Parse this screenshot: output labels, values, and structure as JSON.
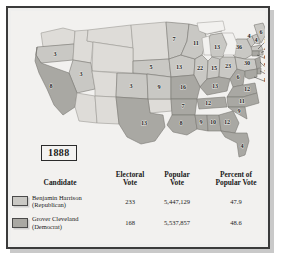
{
  "figure": {
    "year_label": "1888",
    "colors": {
      "republican_fill": "#c9c8c4",
      "democrat_fill": "#a9a8a3",
      "territory_fill": "#dedcd8",
      "water_fill": "#f2f1ef",
      "border": "#7a7874",
      "frame": "#3b3b3b",
      "text": "#1b1b1b"
    }
  },
  "map": {
    "title": "Electoral vote map of the 1888 United States presidential election",
    "state_labels": [
      {
        "state": "Oregon",
        "value": "3",
        "party": "republican"
      },
      {
        "state": "California",
        "value": "8",
        "party": "democrat"
      },
      {
        "state": "Nevada",
        "value": "3",
        "party": "republican"
      },
      {
        "state": "Colorado",
        "value": "3",
        "party": "republican"
      },
      {
        "state": "Nebraska",
        "value": "5",
        "party": "republican"
      },
      {
        "state": "Kansas",
        "value": "9",
        "party": "republican"
      },
      {
        "state": "Texas",
        "value": "13",
        "party": "democrat"
      },
      {
        "state": "Minnesota",
        "value": "7",
        "party": "republican"
      },
      {
        "state": "Iowa",
        "value": "13",
        "party": "republican"
      },
      {
        "state": "Wisconsin",
        "value": "11",
        "party": "republican"
      },
      {
        "state": "Michigan",
        "value": "13",
        "party": "republican"
      },
      {
        "state": "Illinois",
        "value": "22",
        "party": "republican"
      },
      {
        "state": "Indiana",
        "value": "15",
        "party": "republican"
      },
      {
        "state": "Ohio",
        "value": "23",
        "party": "republican"
      },
      {
        "state": "Missouri",
        "value": "16",
        "party": "democrat"
      },
      {
        "state": "Kentucky",
        "value": "13",
        "party": "democrat"
      },
      {
        "state": "West Virginia",
        "value": "6",
        "party": "democrat"
      },
      {
        "state": "Virginia",
        "value": "12",
        "party": "democrat"
      },
      {
        "state": "Tennessee",
        "value": "12",
        "party": "democrat"
      },
      {
        "state": "Arkansas",
        "value": "7",
        "party": "democrat"
      },
      {
        "state": "Louisiana",
        "value": "8",
        "party": "democrat"
      },
      {
        "state": "Mississippi",
        "value": "9",
        "party": "democrat"
      },
      {
        "state": "Alabama",
        "value": "10",
        "party": "democrat"
      },
      {
        "state": "Georgia",
        "value": "12",
        "party": "democrat"
      },
      {
        "state": "South Carolina",
        "value": "9",
        "party": "democrat"
      },
      {
        "state": "North Carolina",
        "value": "11",
        "party": "democrat"
      },
      {
        "state": "Florida",
        "value": "4",
        "party": "democrat"
      },
      {
        "state": "Maine",
        "value": "6",
        "party": "republican"
      },
      {
        "state": "New Hampshire",
        "value": "4",
        "party": "republican"
      },
      {
        "state": "Vermont",
        "value": "4",
        "party": "republican"
      },
      {
        "state": "New York",
        "value": "36",
        "party": "republican"
      },
      {
        "state": "Pennsylvania",
        "value": "30",
        "party": "republican"
      }
    ],
    "callout_labels": [
      {
        "state": "Massachusetts",
        "value": "14",
        "party": "republican"
      },
      {
        "state": "Rhode Island",
        "value": "4",
        "party": "republican"
      },
      {
        "state": "Connecticut",
        "value": "6",
        "party": "democrat"
      },
      {
        "state": "New Jersey",
        "value": "9",
        "party": "democrat"
      },
      {
        "state": "Delaware",
        "value": "3",
        "party": "democrat"
      },
      {
        "state": "Maryland",
        "value": "8",
        "party": "democrat"
      }
    ]
  },
  "table": {
    "headers": {
      "candidate": {
        "line1": "Candidate",
        "line2": ""
      },
      "electoral": {
        "line1": "Electoral",
        "line2": "Vote"
      },
      "popular": {
        "line1": "Popular",
        "line2": "Vote"
      },
      "percent": {
        "line1": "Percent of",
        "line2": "Popular Vote"
      }
    },
    "rows": [
      {
        "name": "Benjamin Harrison",
        "party": "(Republican)",
        "electoral_vote": "233",
        "popular_vote": "5,447,129",
        "percent_popular_vote": "47.9"
      },
      {
        "name": "Grover Cleveland",
        "party": "(Democrat)",
        "electoral_vote": "168",
        "popular_vote": "5,537,857",
        "percent_popular_vote": "48.6"
      }
    ]
  }
}
